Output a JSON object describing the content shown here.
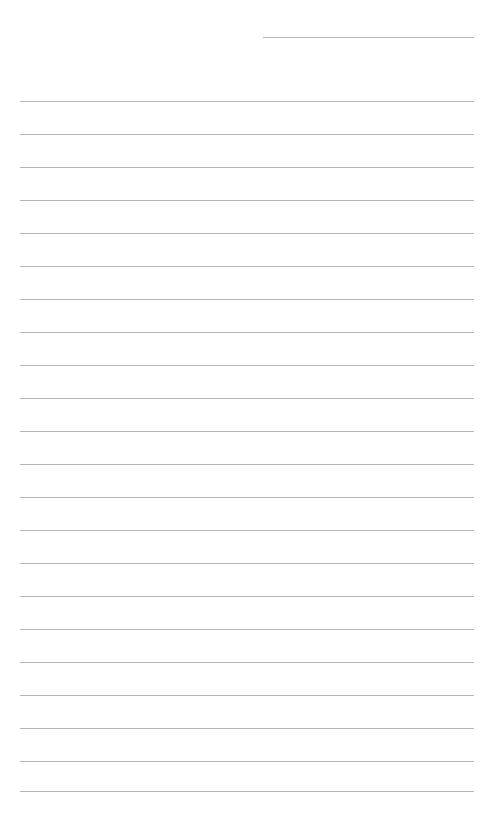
{
  "page": {
    "type": "lined-paper",
    "background_color": "#ffffff",
    "line_color": "#b4b4b4"
  },
  "header_line": {
    "x1": 263,
    "x2": 474,
    "y": 37
  },
  "ruled_lines": {
    "x1": 20,
    "x2": 474,
    "y_positions": [
      101,
      134,
      167,
      200,
      233,
      266,
      299,
      332,
      365,
      398,
      431,
      464,
      497,
      530,
      563,
      596,
      629,
      662,
      695,
      728,
      761,
      791
    ]
  }
}
